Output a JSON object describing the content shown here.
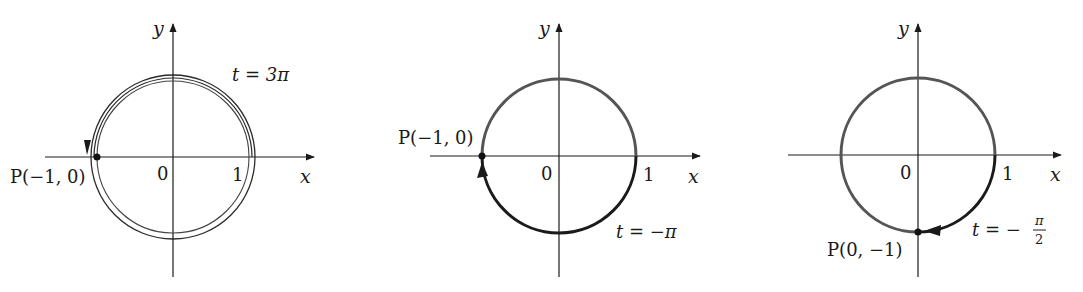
{
  "figure": {
    "panels": [
      {
        "id": "panel-1",
        "x_axis_label": "x",
        "y_axis_label": "y",
        "origin_label": "0",
        "one_label": "1",
        "point_label": "P(−1, 0)",
        "t_label": "t = 3π",
        "description": "Counterclockwise path winding 1.5 times around the unit circle, ending at P(-1,0)"
      },
      {
        "id": "panel-2",
        "x_axis_label": "x",
        "y_axis_label": "y",
        "origin_label": "0",
        "one_label": "1",
        "point_label": "P(−1, 0)",
        "t_label": "t = −π",
        "description": "Clockwise half-circle from (1,0) through bottom to P(-1,0)"
      },
      {
        "id": "panel-3",
        "x_axis_label": "x",
        "y_axis_label": "y",
        "origin_label": "0",
        "one_label": "1",
        "point_label": "P(0, −1)",
        "t_label_prefix": "t = −",
        "t_label_num": "π",
        "t_label_den": "2",
        "description": "Clockwise quarter-circle from (1,0) to P(0,-1)"
      }
    ],
    "colors": {
      "axis": "#1a1a1a",
      "circle": "#555555",
      "path": "#1a1a1a",
      "point": "#111111"
    }
  }
}
